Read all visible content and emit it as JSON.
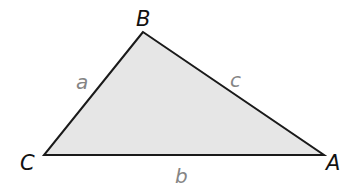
{
  "diagram": {
    "type": "triangle",
    "fill_color": "#e6e6e6",
    "stroke_color": "#1a1a1a",
    "vertices": {
      "B": {
        "label": "B",
        "x": 143,
        "y": 32
      },
      "C": {
        "label": "C",
        "x": 44,
        "y": 155
      },
      "A": {
        "label": "A",
        "x": 324,
        "y": 155
      }
    },
    "sides": {
      "a": {
        "label": "a",
        "between": [
          "B",
          "C"
        ]
      },
      "b": {
        "label": "b",
        "between": [
          "C",
          "A"
        ]
      },
      "c": {
        "label": "c",
        "between": [
          "B",
          "A"
        ]
      }
    },
    "vertex_label_color": "#111111",
    "side_label_color": "#858585"
  }
}
